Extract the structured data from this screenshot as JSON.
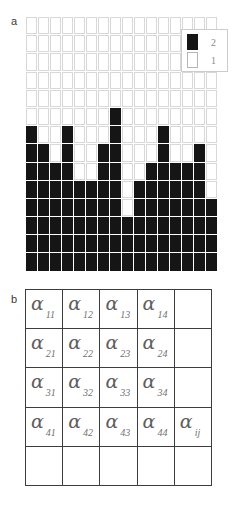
{
  "figure": {
    "panel_a": {
      "label": "a",
      "grid": {
        "columns": 16,
        "rows": 14,
        "on_color": "#151515",
        "off_color": "#ffffff",
        "cells": [
          [
            0,
            0,
            0,
            0,
            0,
            0,
            0,
            0,
            0,
            0,
            0,
            0,
            0,
            0,
            0,
            0
          ],
          [
            0,
            0,
            0,
            0,
            0,
            0,
            0,
            0,
            0,
            0,
            0,
            0,
            0,
            0,
            0,
            0
          ],
          [
            0,
            0,
            0,
            0,
            0,
            0,
            0,
            0,
            0,
            0,
            0,
            0,
            0,
            0,
            0,
            0
          ],
          [
            0,
            0,
            0,
            0,
            0,
            0,
            0,
            0,
            0,
            0,
            0,
            0,
            0,
            0,
            0,
            0
          ],
          [
            0,
            0,
            0,
            0,
            0,
            0,
            0,
            0,
            0,
            0,
            0,
            0,
            0,
            0,
            0,
            0
          ],
          [
            0,
            0,
            0,
            0,
            0,
            0,
            0,
            1,
            0,
            0,
            0,
            0,
            0,
            0,
            0,
            0
          ],
          [
            1,
            0,
            0,
            1,
            0,
            0,
            0,
            1,
            0,
            0,
            0,
            1,
            0,
            0,
            0,
            0
          ],
          [
            1,
            1,
            0,
            1,
            0,
            0,
            1,
            1,
            0,
            0,
            0,
            1,
            0,
            0,
            1,
            0
          ],
          [
            1,
            1,
            1,
            1,
            0,
            0,
            1,
            1,
            0,
            0,
            1,
            1,
            1,
            1,
            1,
            0
          ],
          [
            1,
            1,
            1,
            1,
            1,
            1,
            1,
            1,
            0,
            1,
            1,
            1,
            1,
            1,
            1,
            0
          ],
          [
            1,
            1,
            1,
            1,
            1,
            1,
            1,
            1,
            0,
            1,
            1,
            1,
            1,
            1,
            1,
            1
          ],
          [
            1,
            1,
            1,
            1,
            1,
            1,
            1,
            1,
            1,
            1,
            1,
            1,
            1,
            1,
            1,
            1
          ],
          [
            1,
            1,
            1,
            1,
            1,
            1,
            1,
            1,
            1,
            1,
            1,
            1,
            1,
            1,
            1,
            1
          ],
          [
            1,
            1,
            1,
            1,
            1,
            1,
            1,
            1,
            1,
            1,
            1,
            1,
            1,
            1,
            1,
            1
          ]
        ]
      },
      "legend": {
        "entries": [
          {
            "swatch": "filled",
            "label": "2"
          },
          {
            "swatch": "empty",
            "label": "1"
          }
        ]
      }
    },
    "panel_b": {
      "label": "b",
      "matrix": {
        "columns": 5,
        "rows": 5,
        "cells": [
          [
            {
              "symbol": "α",
              "subscript": "11"
            },
            {
              "symbol": "α",
              "subscript": "12"
            },
            {
              "symbol": "α",
              "subscript": "13"
            },
            {
              "symbol": "α",
              "subscript": "14"
            },
            {
              "symbol": "",
              "subscript": ""
            }
          ],
          [
            {
              "symbol": "α",
              "subscript": "21"
            },
            {
              "symbol": "α",
              "subscript": "22"
            },
            {
              "symbol": "α",
              "subscript": "23"
            },
            {
              "symbol": "α",
              "subscript": "24"
            },
            {
              "symbol": "",
              "subscript": ""
            }
          ],
          [
            {
              "symbol": "α",
              "subscript": "31"
            },
            {
              "symbol": "α",
              "subscript": "32"
            },
            {
              "symbol": "α",
              "subscript": "33"
            },
            {
              "symbol": "α",
              "subscript": "34"
            },
            {
              "symbol": "",
              "subscript": ""
            }
          ],
          [
            {
              "symbol": "α",
              "subscript": "41"
            },
            {
              "symbol": "α",
              "subscript": "42"
            },
            {
              "symbol": "α",
              "subscript": "43"
            },
            {
              "symbol": "α",
              "subscript": "44"
            },
            {
              "symbol": "α",
              "subscript": "ij"
            }
          ],
          [
            {
              "symbol": "",
              "subscript": ""
            },
            {
              "symbol": "",
              "subscript": ""
            },
            {
              "symbol": "",
              "subscript": ""
            },
            {
              "symbol": "",
              "subscript": ""
            },
            {
              "symbol": "",
              "subscript": ""
            }
          ]
        ]
      }
    }
  }
}
